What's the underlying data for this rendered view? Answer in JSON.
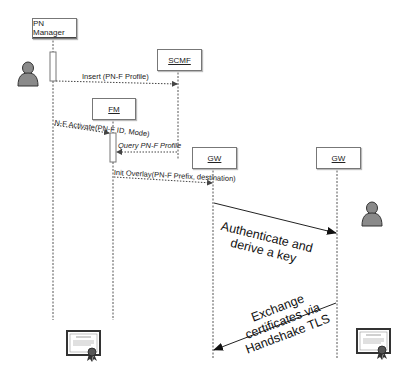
{
  "participants": [
    {
      "id": "pn_manager",
      "label": "PN Manager"
    },
    {
      "id": "scmf",
      "label": "SCMF"
    },
    {
      "id": "fm",
      "label": "FM"
    },
    {
      "id": "gw1",
      "label": "GW"
    },
    {
      "id": "gw2",
      "label": "GW"
    }
  ],
  "messages": [
    {
      "from": "pn_manager",
      "to": "scmf",
      "label": "Insert (PN-F Profile)",
      "style": "dotted"
    },
    {
      "from": "pn_manager",
      "to": "fm",
      "label": "N-F Activate(PN-F ID,  Mode)",
      "style": "dotted"
    },
    {
      "from": "scmf",
      "to": "fm",
      "label": "Query PN-F Profile",
      "style": "dotted"
    },
    {
      "from": "fm",
      "to": "gw1",
      "label": "Init  Overlay(PN-F Prefix, destination)",
      "style": "dotted"
    },
    {
      "from": "gw1",
      "to": "gw2",
      "label_line1": "Authenticate and",
      "label_line2": "derive a key",
      "style": "solid"
    },
    {
      "from": "gw2",
      "to": "gw1",
      "label_line1": "Exchange",
      "label_line2": "certificates via",
      "label_line3": "Handshake TLS",
      "style": "solid"
    }
  ],
  "icons": {
    "left_user": "user-icon",
    "right_user": "user-icon",
    "left_cert": "certificate-icon",
    "right_cert": "certificate-icon"
  },
  "colors": {
    "line": "#555555",
    "box_border": "#777777",
    "person_fill": "#8a8a8a",
    "person_stroke": "#333333"
  }
}
